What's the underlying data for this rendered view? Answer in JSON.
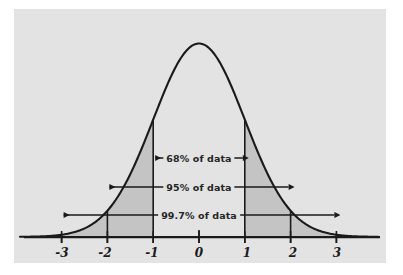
{
  "figure": {
    "name": "empirical-rule-normal-distribution",
    "background_color": "#ffffff",
    "plot_background_color": "#e3e3e3",
    "curve_color": "#1a1a1a",
    "shade_color": "#c4c4c4",
    "axis_color": "#1a1a1a"
  },
  "chart_data": {
    "type": "line",
    "title": "",
    "subtitle": "",
    "xlabel": "",
    "ylabel": "",
    "grid": false,
    "legend": "none",
    "distribution": "standard normal (bell curve)",
    "xlim": [
      -3.6,
      3.6
    ],
    "ylim": [
      0,
      1.08
    ],
    "x_ticks": [
      -3,
      -2,
      -1,
      0,
      1,
      2,
      3
    ],
    "x_tick_labels": [
      "-3",
      "-2",
      "-1",
      "0",
      "1",
      "2",
      "3"
    ],
    "y_ticks": [],
    "y_tick_labels": [],
    "series": [
      {
        "name": "normal density",
        "x": [
          -3.6,
          -3.4,
          -3.2,
          -3.0,
          -2.8,
          -2.6,
          -2.4,
          -2.2,
          -2.0,
          -1.8,
          -1.6,
          -1.4,
          -1.2,
          -1.0,
          -0.8,
          -0.6,
          -0.4,
          -0.2,
          0.0,
          0.2,
          0.4,
          0.6,
          0.8,
          1.0,
          1.2,
          1.4,
          1.6,
          1.8,
          2.0,
          2.2,
          2.4,
          2.6,
          2.8,
          3.0,
          3.2,
          3.4,
          3.6
        ],
        "values": [
          0.0015,
          0.0034,
          0.0077,
          0.0111,
          0.0198,
          0.034,
          0.0561,
          0.0889,
          0.1353,
          0.1979,
          0.278,
          0.3753,
          0.4868,
          0.6065,
          0.7261,
          0.8353,
          0.9231,
          0.9802,
          1.0,
          0.9802,
          0.9231,
          0.8353,
          0.7261,
          0.6065,
          0.4868,
          0.3753,
          0.278,
          0.1979,
          0.1353,
          0.0889,
          0.0561,
          0.034,
          0.0198,
          0.0111,
          0.0077,
          0.0034,
          0.0015
        ]
      }
    ],
    "vertical_lines": [
      -3,
      -2,
      -1,
      0,
      1,
      2,
      3
    ],
    "shaded_regions": [
      {
        "from": -3.6,
        "to": -1,
        "label": "left tail beyond -1 sigma"
      },
      {
        "from": 1,
        "to": 3.6,
        "label": "right tail beyond +1 sigma"
      }
    ],
    "annotations": [
      {
        "id": "band-68",
        "text": "68% of data",
        "from": -1,
        "to": 1,
        "value": 68
      },
      {
        "id": "band-95",
        "text": "95% of data",
        "from": -2,
        "to": 2,
        "value": 95
      },
      {
        "id": "band-997",
        "text": "99.7% of data",
        "from": -3,
        "to": 3,
        "value": 99.7
      }
    ]
  },
  "annotations": {
    "band_68": "68% of data",
    "band_95": "95% of data",
    "band_997": "99.7% of data"
  },
  "axis": {
    "ticks": [
      {
        "label": "-3"
      },
      {
        "label": "-2"
      },
      {
        "label": "-1"
      },
      {
        "label": "0"
      },
      {
        "label": "1"
      },
      {
        "label": "2"
      },
      {
        "label": "3"
      }
    ]
  }
}
